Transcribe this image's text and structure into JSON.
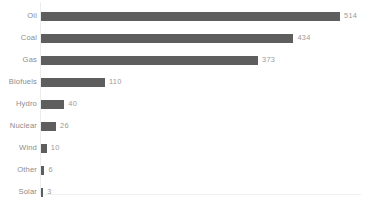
{
  "chart_data": {
    "type": "bar",
    "orientation": "horizontal",
    "title": "",
    "subtitle": "",
    "xlabel": "",
    "ylabel": "",
    "grid": false,
    "legend": null,
    "xlim": [
      0,
      514
    ],
    "categories": [
      "Oil",
      "Coal",
      "Gas",
      "Biofuels",
      "Hydro",
      "Nuclear",
      "Wind",
      "Other",
      "Solar"
    ],
    "values": [
      514,
      434,
      373,
      110,
      40,
      26,
      10,
      6,
      3
    ],
    "value_labels": [
      "514",
      "434",
      "373",
      "110",
      "40",
      "26",
      "10",
      "6",
      "3"
    ],
    "bars": [
      {
        "category": "Oil",
        "value": 514,
        "label": "514"
      },
      {
        "category": "Coal",
        "value": 434,
        "label": "434"
      },
      {
        "category": "Gas",
        "value": 373,
        "label": "373"
      },
      {
        "category": "Biofuels",
        "value": 110,
        "label": "110"
      },
      {
        "category": "Hydro",
        "value": 40,
        "label": "40"
      },
      {
        "category": "Nuclear",
        "value": 26,
        "label": "26"
      },
      {
        "category": "Wind",
        "value": 10,
        "label": "10"
      },
      {
        "category": "Other",
        "value": 6,
        "label": "6"
      },
      {
        "category": "Solar",
        "value": 3,
        "label": "3"
      }
    ]
  },
  "colors": {
    "bar": "#5e5e5e",
    "category_label": "#8c8c8c",
    "value_label": "#9a9a9a",
    "axis_line": "#eceded",
    "background": "#ffffff"
  }
}
